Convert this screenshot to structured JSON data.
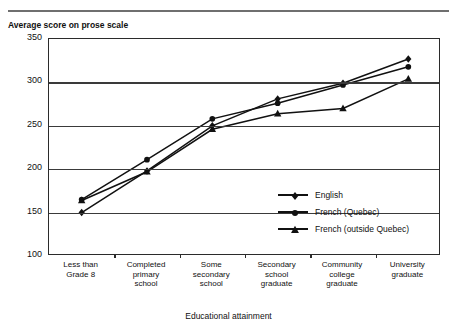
{
  "figure": {
    "y_axis_title": "Average score on prose scale",
    "x_axis_title": "Educational attainment"
  },
  "legend": {
    "items": [
      {
        "label": "English",
        "marker": "diamond-marker"
      },
      {
        "label": "French (Quebec)",
        "marker": "circle-marker"
      },
      {
        "label": "French (outside Quebec)",
        "marker": "triangle-marker"
      }
    ]
  },
  "chart_data": {
    "type": "line",
    "title": "",
    "xlabel": "Educational attainment",
    "ylabel": "Average score on prose scale",
    "ylim": [
      100,
      350
    ],
    "yticks": [
      100,
      150,
      200,
      250,
      300,
      350
    ],
    "ytick_labels": [
      "100",
      "150",
      "200",
      "250",
      "300",
      "350"
    ],
    "grid": true,
    "legend_position": "inside-lower-right",
    "categories": [
      "Less than Grade 8",
      "Completed primary school",
      "Some secondary school",
      "Secondary school graduate",
      "Community college graduate",
      "University graduate"
    ],
    "category_lines": [
      [
        "Less than",
        "Grade 8"
      ],
      [
        "Completed",
        "primary",
        "school"
      ],
      [
        "Some",
        "secondary",
        "school"
      ],
      [
        "Secondary",
        "school",
        "graduate"
      ],
      [
        "Community",
        "college",
        "graduate"
      ],
      [
        "University",
        "graduate"
      ]
    ],
    "series": [
      {
        "name": "English",
        "marker": "diamond",
        "values": [
          150,
          198,
          250,
          281,
          299,
          327
        ]
      },
      {
        "name": "French (Quebec)",
        "marker": "circle",
        "values": [
          165,
          211,
          258,
          276,
          297,
          318
        ]
      },
      {
        "name": "French (outside Quebec)",
        "marker": "triangle",
        "values": [
          164,
          197,
          246,
          264,
          270,
          304
        ]
      }
    ]
  }
}
